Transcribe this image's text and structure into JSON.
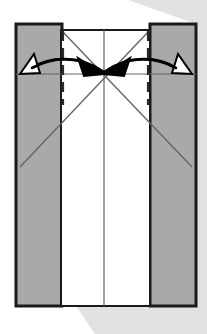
{
  "figure": {
    "type": "origami-fold-diagram",
    "canvas": {
      "width": 207,
      "height": 334
    }
  },
  "colors": {
    "background": "#ffffff",
    "panel_shaded": "#a9a9a9",
    "panel_white": "#ffffff",
    "outline": "#1a1a1a",
    "crease_line": "#666666",
    "shadow": "#e2e2e2",
    "arrow_solid": "#000000",
    "arrow_hollow_fill": "#ffffff"
  },
  "shadow": {
    "name": "drop-shadow-band",
    "points": "128,0 207,0 207,334 95,334 72,300 196,300 196,24"
  },
  "panels": [
    {
      "name": "left-shaded-panel",
      "label": "Left flap",
      "x": 16,
      "y": 24,
      "width": 46,
      "height": 282,
      "fill": "#a9a9a9",
      "stroke": "#1a1a1a",
      "stroke_width": 3
    },
    {
      "name": "center-white-panel",
      "label": "Center body",
      "x": 61,
      "y": 30,
      "width": 89,
      "height": 276,
      "fill": "#ffffff",
      "stroke": "#1a1a1a",
      "stroke_width": 2
    },
    {
      "name": "right-shaded-panel",
      "label": "Right flap",
      "x": 150,
      "y": 24,
      "width": 46,
      "height": 282,
      "fill": "#a9a9a9",
      "stroke": "#1a1a1a",
      "stroke_width": 3
    }
  ],
  "lines": {
    "center_vertical": {
      "name": "center-fold-line",
      "x1": 104,
      "y1": 30,
      "x2": 104,
      "y2": 306
    },
    "horizontal_guide": {
      "name": "horizontal-guide-line",
      "x1": 16,
      "y1": 74,
      "x2": 196,
      "y2": 74
    },
    "diagonal_down_right": {
      "name": "crease-diagonal-down-right",
      "x1": 62,
      "y1": 31,
      "x2": 192,
      "y2": 167
    },
    "diagonal_down_left": {
      "name": "crease-diagonal-down-left",
      "x1": 149,
      "y1": 31,
      "x2": 20,
      "y2": 167
    },
    "dashed_left": {
      "name": "dashed-fold-left",
      "x": 63,
      "y1": 31,
      "y2": 105
    },
    "dashed_right": {
      "name": "dashed-fold-right",
      "x": 148,
      "y1": 31,
      "y2": 105
    }
  },
  "arrows": [
    {
      "name": "arrow-left-outward",
      "style": "hollow",
      "direction": "points-up-left",
      "path": "M 104,72 C 80,55 50,56 32,68",
      "head_points": "20,74 34,54 40,73",
      "meaning": "unfold / open left flap"
    },
    {
      "name": "arrow-left-inward",
      "style": "solid",
      "direction": "points-right",
      "path": "M 32,68 C 54,56 80,56 96,70",
      "head_points": "104,74 78,58 84,76",
      "meaning": "fold left flap inward to center"
    },
    {
      "name": "arrow-right-outward",
      "style": "hollow",
      "direction": "points-up-right",
      "path": "M 104,72 C 128,55 158,56 176,68",
      "head_points": "192,74 178,54 172,73",
      "meaning": "unfold / open right flap"
    },
    {
      "name": "arrow-right-inward",
      "style": "solid",
      "direction": "points-left",
      "path": "M 176,68 C 154,56 128,56 112,70",
      "head_points": "104,74 130,58 124,76",
      "meaning": "fold right flap inward to center"
    }
  ]
}
